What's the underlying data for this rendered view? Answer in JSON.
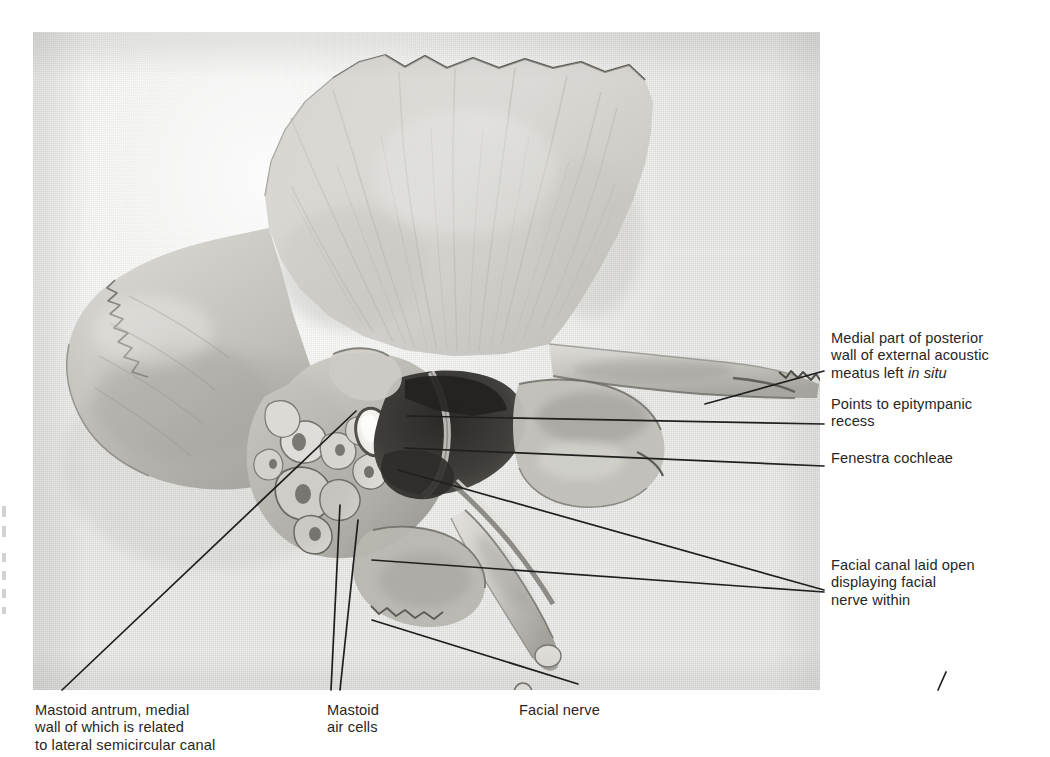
{
  "plate": {
    "kind": "anatomical-photograph-plate",
    "subject": "Temporal bone dissection, lateral view",
    "background_color": "#ffffff",
    "photo_tone": "#f1f1ef",
    "ink_color": "#262626"
  },
  "labels": {
    "medial_wall": "Medial part of posterior\nwall of external acoustic\nmeatus left ",
    "medial_wall_italic": "in situ",
    "epitympanic": "Points to epitympanic\nrecess",
    "fenestra": "Fenestra cochleae",
    "facial_canal": "Facial canal laid open\ndisplaying facial\nnerve within",
    "mastoid_antrum": "Mastoid antrum, medial\nwall of which is related\nto lateral semicircular canal",
    "mastoid_cells": "Mastoid\nair cells",
    "facial_nerve": "Facial nerve"
  },
  "leaders": [
    {
      "name": "medial-wall-leader",
      "x1": 705,
      "y1": 404,
      "x2": 824,
      "y2": 371
    },
    {
      "name": "epitympanic-leader",
      "x1": 407,
      "y1": 416,
      "x2": 824,
      "y2": 424
    },
    {
      "name": "fenestra-leader",
      "x1": 404,
      "y1": 448,
      "x2": 824,
      "y2": 466
    },
    {
      "name": "facial-canal-leader",
      "x1": 398,
      "y1": 470,
      "x2": 824,
      "y2": 590
    },
    {
      "name": "facial-canal-leader-2",
      "x1": 372,
      "y1": 560,
      "x2": 824,
      "y2": 592
    },
    {
      "name": "mastoid-antrum-leader",
      "x1": 356,
      "y1": 411,
      "x2": 62,
      "y2": 690
    },
    {
      "name": "mastoid-cells-leader-a",
      "x1": 340,
      "y1": 505,
      "x2": 331,
      "y2": 690
    },
    {
      "name": "mastoid-cells-leader-b",
      "x1": 358,
      "y1": 520,
      "x2": 340,
      "y2": 690
    },
    {
      "name": "facial-nerve-leader",
      "x1": 372,
      "y1": 620,
      "x2": 578,
      "y2": 684
    },
    {
      "name": "corner-tick",
      "x1": 946,
      "y1": 672,
      "x2": 938,
      "y2": 690
    }
  ]
}
